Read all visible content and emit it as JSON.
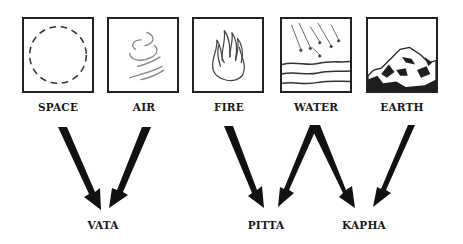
{
  "elements": [
    {
      "id": "space",
      "label": "SPACE",
      "icon": "dashed-circle-icon"
    },
    {
      "id": "air",
      "label": "AIR",
      "icon": "wind-swirl-icon"
    },
    {
      "id": "fire",
      "label": "FIRE",
      "icon": "flame-icon"
    },
    {
      "id": "water",
      "label": "WATER",
      "icon": "rain-waves-icon"
    },
    {
      "id": "earth",
      "label": "EARTH",
      "icon": "rock-icon"
    }
  ],
  "doshas": [
    {
      "id": "vata",
      "label": "VATA",
      "sources": [
        "SPACE",
        "AIR"
      ]
    },
    {
      "id": "pitta",
      "label": "PITTA",
      "sources": [
        "FIRE",
        "WATER"
      ]
    },
    {
      "id": "kapha",
      "label": "KAPHA",
      "sources": [
        "WATER",
        "EARTH"
      ]
    }
  ],
  "colors": {
    "stroke": "#222222",
    "background": "#ffffff"
  }
}
